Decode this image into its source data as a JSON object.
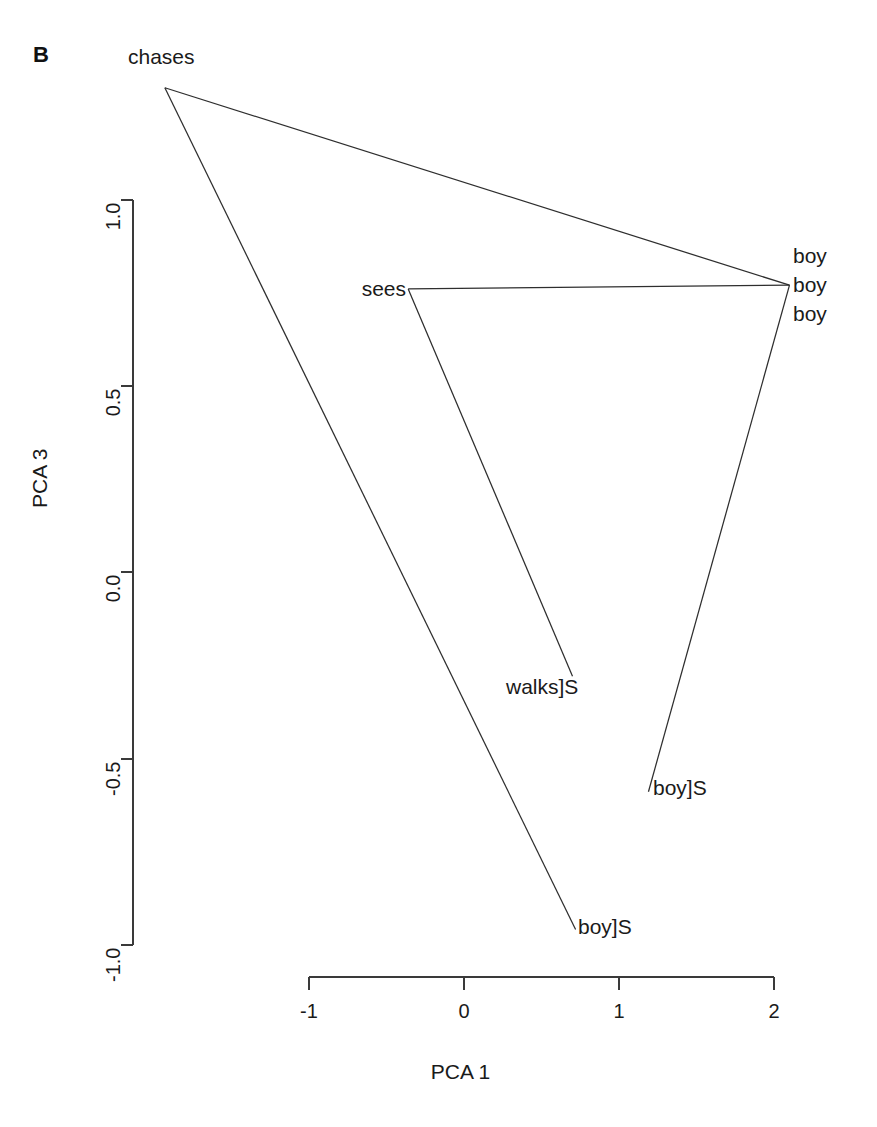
{
  "panel": {
    "letter": "B"
  },
  "axes": {
    "x": {
      "label": "PCA 1",
      "ticks": [
        "-1",
        "0",
        "1",
        "2"
      ],
      "tick_values": [
        -1,
        0,
        1,
        2
      ],
      "range": [
        -1,
        2
      ]
    },
    "y": {
      "label": "PCA 3",
      "ticks": [
        "1.0",
        "0.5",
        "0.0",
        "-0.5",
        "-1.0"
      ],
      "tick_values": [
        1.0,
        0.5,
        0.0,
        -0.5,
        -1.0
      ],
      "range": [
        -1.0,
        1.0
      ]
    }
  },
  "node_labels": [
    {
      "id": "chases",
      "text": "chases"
    },
    {
      "id": "boy-1",
      "text": "boy"
    },
    {
      "id": "boy-2",
      "text": "boy"
    },
    {
      "id": "boy-3",
      "text": "boy"
    },
    {
      "id": "sees",
      "text": "sees"
    },
    {
      "id": "walks-s",
      "text": "walks]S"
    },
    {
      "id": "boy-s-mid",
      "text": "boy]S"
    },
    {
      "id": "boy-s-low",
      "text": "boy]S"
    }
  ],
  "chart_data": {
    "type": "scatter",
    "title": "",
    "subtitle": "",
    "xlabel": "PCA 1",
    "ylabel": "PCA 3",
    "xlim": [
      -2.1,
      2.3
    ],
    "ylim": [
      -1.05,
      1.4
    ],
    "xticks": [
      -1,
      0,
      1,
      2
    ],
    "yticks": [
      1.0,
      0.5,
      0.0,
      -0.5,
      -1.0
    ],
    "grid": false,
    "legend": null,
    "points": [
      {
        "label": "chases",
        "x": -1.93,
        "y": 1.3
      },
      {
        "label": "boy",
        "x": 2.1,
        "y": 0.77
      },
      {
        "label": "sees",
        "x": -0.36,
        "y": 0.76
      },
      {
        "label": "walks]S",
        "x": 0.7,
        "y": -0.28
      },
      {
        "label": "boy]S",
        "x": 1.19,
        "y": -0.59
      },
      {
        "label": "boy]S",
        "x": 0.72,
        "y": -0.96
      }
    ],
    "edges": [
      {
        "from": "chases",
        "to": "boy",
        "x1": -1.93,
        "y1": 1.3,
        "x2": 2.1,
        "y2": 0.77
      },
      {
        "from": "chases",
        "to": "boy]S",
        "x1": -1.93,
        "y1": 1.3,
        "x2": 0.72,
        "y2": -0.96
      },
      {
        "from": "sees",
        "to": "boy",
        "x1": -0.36,
        "y1": 0.76,
        "x2": 2.1,
        "y2": 0.77
      },
      {
        "from": "sees",
        "to": "walks]S",
        "x1": -0.36,
        "y1": 0.76,
        "x2": 0.7,
        "y2": -0.28
      },
      {
        "from": "boy",
        "to": "boy]S",
        "x1": 2.1,
        "y1": 0.77,
        "x2": 1.19,
        "y2": -0.59
      }
    ],
    "annotations": [
      {
        "text": "chases",
        "x": -1.93,
        "y": 1.3
      },
      {
        "text": "boy",
        "x": 2.1,
        "y": 0.9
      },
      {
        "text": "boy",
        "x": 2.1,
        "y": 0.77
      },
      {
        "text": "boy",
        "x": 2.1,
        "y": 0.64
      },
      {
        "text": "sees",
        "x": -0.36,
        "y": 0.76
      },
      {
        "text": "walks]S",
        "x": 0.7,
        "y": -0.28
      },
      {
        "text": "boy]S",
        "x": 1.19,
        "y": -0.59
      },
      {
        "text": "boy]S",
        "x": 0.72,
        "y": -0.96
      }
    ]
  },
  "colors": {
    "background": "#ffffff",
    "line": "#2e2e2e",
    "axis": "#3a3a3a",
    "text": "#1a1a1a"
  }
}
